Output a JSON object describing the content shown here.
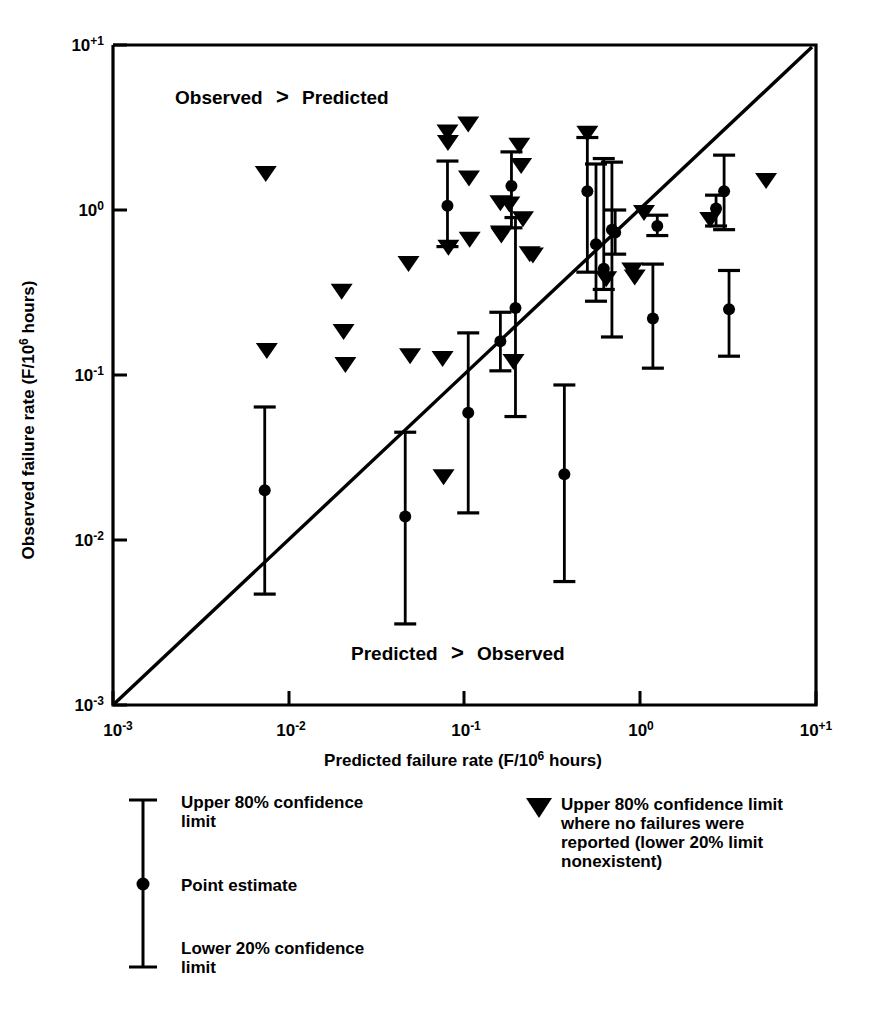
{
  "figure": {
    "background_color": "#ffffff",
    "ink_color": "#000000"
  },
  "axes": {
    "x_title_parts": {
      "main": "Predicted failure rate (F/10",
      "sup": "6",
      "tail": " hours)"
    },
    "y_title_parts": {
      "main": "Observed failure rate (F/10",
      "sup": "6",
      "tail": " hours)"
    },
    "x_tick_labels": [
      "10−3",
      "10−2",
      "10−1",
      "10⁰",
      "10⁺¹"
    ],
    "y_tick_labels": [
      "10−3",
      "10−2",
      "10−1",
      "10⁰",
      "10⁺¹"
    ],
    "x_tick_base": [
      "10",
      "10",
      "10",
      "10",
      "10"
    ],
    "x_tick_exp": [
      "-3",
      "-2",
      "-1",
      "0",
      "+1"
    ],
    "y_tick_exp": [
      "-3",
      "-2",
      "-1",
      "0",
      "+1"
    ]
  },
  "annotations": {
    "upper_left": "Observed > Predicted",
    "lower_right": "Predicted > Observed",
    "upper_left_pre": "Observed",
    "upper_left_gt": ">",
    "upper_left_post": "Predicted",
    "lower_right_pre": "Predicted",
    "lower_right_gt": ">",
    "lower_right_post": "Observed"
  },
  "legend": {
    "left": {
      "upper": "Upper 80% confidence limit",
      "upper_l1": "Upper 80% confidence",
      "upper_l2": "limit",
      "point": "Point estimate",
      "lower_l1": "Lower 20% confidence",
      "lower_l2": "limit"
    },
    "right": {
      "full": "Upper 80% confidence limit where no failures were reported (lower 20% limit nonexistent)",
      "l1": "Upper 80% confidence limit",
      "l2": "where no failures were",
      "l3": "reported (lower 20% limit",
      "l4": "nonexistent)"
    }
  },
  "chart_data": {
    "type": "scatter",
    "title": "",
    "xlabel": "Predicted failure rate (F/10^6 hours)",
    "ylabel": "Observed failure rate (F/10^6 hours)",
    "xscale": "log",
    "yscale": "log",
    "xlim": [
      0.001,
      10
    ],
    "ylim": [
      0.001,
      10
    ],
    "grid": false,
    "legend_position": "below-plot",
    "reference_line": {
      "label": "y = x (parity line)",
      "from": [
        0.001,
        0.001
      ],
      "to": [
        10,
        10
      ]
    },
    "series": [
      {
        "name": "Point estimate with 80%/20% confidence limits",
        "marker": "circle-with-errorbar",
        "points": [
          {
            "x": 0.0073,
            "y": 0.02,
            "ylow": 0.0047,
            "yhigh": 0.064
          },
          {
            "x": 0.046,
            "y": 0.0139,
            "ylow": 0.0031,
            "yhigh": 0.045
          },
          {
            "x": 0.08,
            "y": 1.06,
            "ylow": 0.6,
            "yhigh": 1.98
          },
          {
            "x": 0.105,
            "y": 0.059,
            "ylow": 0.0146,
            "yhigh": 0.18
          },
          {
            "x": 0.16,
            "y": 0.16,
            "ylow": 0.106,
            "yhigh": 0.24
          },
          {
            "x": 0.185,
            "y": 1.4,
            "ylow": 0.78,
            "yhigh": 2.25
          },
          {
            "x": 0.195,
            "y": 0.255,
            "ylow": 0.056,
            "yhigh": 0.9
          },
          {
            "x": 0.37,
            "y": 0.025,
            "ylow": 0.0056,
            "yhigh": 0.087
          },
          {
            "x": 0.5,
            "y": 1.3,
            "ylow": 0.42,
            "yhigh": 2.75
          },
          {
            "x": 0.56,
            "y": 0.62,
            "ylow": 0.28,
            "yhigh": 1.9
          },
          {
            "x": 0.62,
            "y": 0.44,
            "ylow": 0.33,
            "yhigh": 2.05
          },
          {
            "x": 0.69,
            "y": 0.76,
            "ylow": 0.17,
            "yhigh": 1.95
          },
          {
            "x": 0.72,
            "y": 0.73,
            "ylow": 0.54,
            "yhigh": 1.0
          },
          {
            "x": 1.18,
            "y": 0.22,
            "ylow": 0.11,
            "yhigh": 0.47
          },
          {
            "x": 1.25,
            "y": 0.8,
            "ylow": 0.7,
            "yhigh": 0.93
          },
          {
            "x": 2.7,
            "y": 1.02,
            "ylow": 0.8,
            "yhigh": 1.23
          },
          {
            "x": 3.0,
            "y": 1.3,
            "ylow": 0.76,
            "yhigh": 2.15
          },
          {
            "x": 3.2,
            "y": 0.25,
            "ylow": 0.13,
            "yhigh": 0.43
          }
        ]
      },
      {
        "name": "Upper 80% confidence limit, no failures reported",
        "marker": "down-triangle",
        "points": [
          {
            "x": 0.0074,
            "y": 1.65
          },
          {
            "x": 0.0075,
            "y": 0.14
          },
          {
            "x": 0.02,
            "y": 0.32
          },
          {
            "x": 0.0205,
            "y": 0.182
          },
          {
            "x": 0.021,
            "y": 0.115
          },
          {
            "x": 0.048,
            "y": 0.47
          },
          {
            "x": 0.049,
            "y": 0.13
          },
          {
            "x": 0.075,
            "y": 0.125
          },
          {
            "x": 0.076,
            "y": 0.024
          },
          {
            "x": 0.08,
            "y": 2.95
          },
          {
            "x": 0.0805,
            "y": 2.55
          },
          {
            "x": 0.081,
            "y": 0.59
          },
          {
            "x": 0.105,
            "y": 3.3
          },
          {
            "x": 0.106,
            "y": 1.55
          },
          {
            "x": 0.107,
            "y": 0.66
          },
          {
            "x": 0.16,
            "y": 1.1
          },
          {
            "x": 0.161,
            "y": 0.72
          },
          {
            "x": 0.162,
            "y": 0.7
          },
          {
            "x": 0.18,
            "y": 1.08
          },
          {
            "x": 0.19,
            "y": 0.12
          },
          {
            "x": 0.205,
            "y": 2.45
          },
          {
            "x": 0.21,
            "y": 1.85
          },
          {
            "x": 0.215,
            "y": 0.88
          },
          {
            "x": 0.235,
            "y": 0.54
          },
          {
            "x": 0.245,
            "y": 0.53
          },
          {
            "x": 0.5,
            "y": 2.9
          },
          {
            "x": 0.64,
            "y": 0.38
          },
          {
            "x": 0.9,
            "y": 0.43
          },
          {
            "x": 0.93,
            "y": 0.39
          },
          {
            "x": 1.05,
            "y": 0.96
          },
          {
            "x": 2.5,
            "y": 0.87
          },
          {
            "x": 5.2,
            "y": 1.5
          }
        ]
      }
    ]
  }
}
